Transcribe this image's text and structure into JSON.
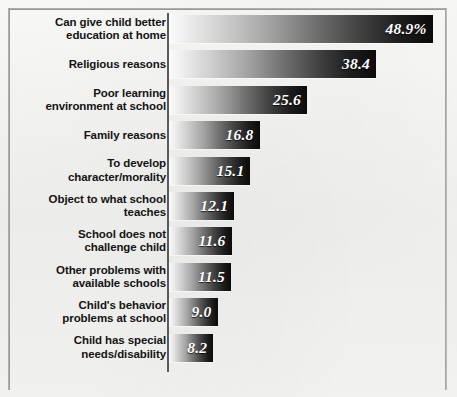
{
  "chart_data": {
    "type": "bar",
    "orientation": "horizontal",
    "title": "",
    "subtitle": "",
    "xlabel": "",
    "ylabel": "",
    "grid": false,
    "legend": null,
    "axis_ranges": {
      "x": [
        0,
        48.9
      ]
    },
    "value_suffix_first_bar": "%",
    "categories": [
      "Can give child better\neducation at home",
      "Religious reasons",
      "Poor learning\nenvironment at school",
      "Family reasons",
      "To develop\ncharacter/morality",
      "Object to what school\nteaches",
      "School does not\nchallenge child",
      "Other problems with\navailable schools",
      "Child's behavior\nproblems at school",
      "Child has special\nneeds/disability"
    ],
    "values": [
      48.9,
      38.4,
      25.6,
      16.8,
      15.1,
      12.1,
      11.6,
      11.5,
      9.0,
      8.2
    ],
    "value_labels": [
      "48.9%",
      "38.4",
      "25.6",
      "16.8",
      "15.1",
      "12.1",
      "11.6",
      "11.5",
      "9.0",
      "8.2"
    ],
    "colors": {
      "bar_gradient_start": "#fbfbfb",
      "bar_gradient_end": "#0b0b0b",
      "background": "#f4f4f2",
      "axis": "#5a5a5a",
      "label_text": "#141414",
      "value_text": "#ffffff"
    }
  },
  "layout": {
    "axis_x_px": 168,
    "bar_start_x_px": 169,
    "px_per_unit": 5.39,
    "first_row_top_px": 15,
    "row_pitch_px": 35.4,
    "bar_height_px": 28
  }
}
